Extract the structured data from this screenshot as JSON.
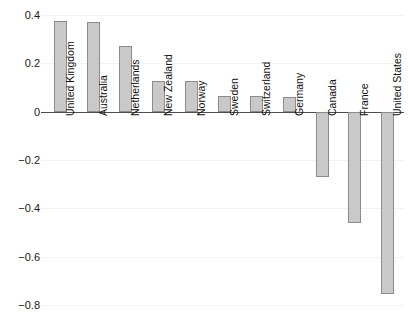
{
  "chart_data": {
    "type": "bar",
    "title": "",
    "subtitle": "",
    "xlabel": "",
    "ylabel": "",
    "categories": [
      "United Kingdom",
      "Australia",
      "Netherlands",
      "New Zealand",
      "Norway",
      "Sweden",
      "Switzerland",
      "Germany",
      "Canada",
      "France",
      "United States"
    ],
    "values": [
      0.376,
      0.372,
      0.27,
      0.128,
      0.128,
      0.066,
      0.066,
      0.062,
      -0.27,
      -0.46,
      -0.753
    ],
    "ylim": [
      -0.85,
      0.43
    ],
    "yticks": [
      0.4,
      0.2,
      0,
      -0.2,
      -0.4,
      -0.6,
      -0.8
    ],
    "ytick_labels": [
      "0.4",
      "0.2",
      "0",
      "−0.2",
      "−0.4",
      "−0.6",
      "−0.8"
    ],
    "grid": true,
    "grid_axis": "y",
    "legend": false,
    "legend_position": "none",
    "bar_fill_color": "#c9c9c9",
    "bar_edge_color": "#8c8c8c",
    "zero_line_color": "#4d4d4d",
    "gridline_color": "#f2f2f2",
    "label_rotation": 90,
    "label_color": "#111111"
  }
}
